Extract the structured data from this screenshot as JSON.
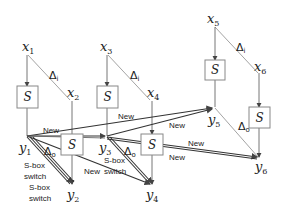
{
  "diagram": {
    "type": "differential-trail",
    "inputs": [
      {
        "name": "x",
        "index": "1"
      },
      {
        "name": "x",
        "index": "2"
      },
      {
        "name": "x",
        "index": "3"
      },
      {
        "name": "x",
        "index": "4"
      },
      {
        "name": "x",
        "index": "5"
      },
      {
        "name": "x",
        "index": "6"
      }
    ],
    "outputs": [
      {
        "name": "y",
        "index": "1"
      },
      {
        "name": "y",
        "index": "2"
      },
      {
        "name": "y",
        "index": "3"
      },
      {
        "name": "y",
        "index": "4"
      },
      {
        "name": "y",
        "index": "5"
      },
      {
        "name": "y",
        "index": "6"
      }
    ],
    "sbox_label": "S",
    "delta_in": {
      "symbol": "Δ",
      "sub": "i"
    },
    "delta_out": {
      "symbol": "Δ",
      "sub": "o"
    },
    "edge_labels": {
      "new": "New",
      "sbox_switch_1": "S-box",
      "sbox_switch_2": "switch"
    }
  }
}
